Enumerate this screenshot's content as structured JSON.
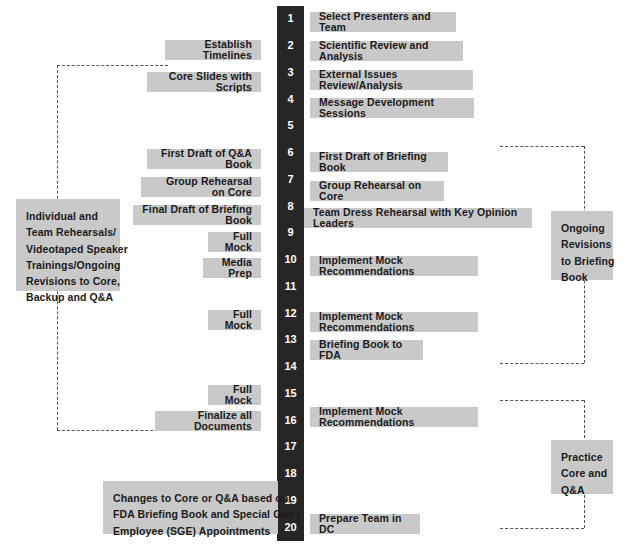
{
  "diagram": {
    "colors": {
      "spine": "#262626",
      "box_fill": "#c9c9c9",
      "box_text": "#1a1a1a",
      "spine_text": "#ffffff",
      "connector": "#555555",
      "background": "#ffffff"
    },
    "spine": {
      "name": "week-number-column",
      "numbers": [
        "1",
        "2",
        "3",
        "4",
        "5",
        "6",
        "7",
        "8",
        "9",
        "10",
        "11",
        "12",
        "13",
        "14",
        "15",
        "16",
        "17",
        "18",
        "19",
        "20"
      ]
    },
    "right_boxes": [
      {
        "label": "Select Presenters and Team",
        "row": 1,
        "x": 310,
        "y": 12,
        "w": 146,
        "h": 20
      },
      {
        "label": "Scientific Review and Analysis",
        "row": 2,
        "x": 310,
        "y": 41,
        "w": 153,
        "h": 20
      },
      {
        "label": "External Issues Review/Analysis",
        "row": 3,
        "x": 310,
        "y": 70,
        "w": 163,
        "h": 20
      },
      {
        "label": "Message Development Sessions",
        "row": 4,
        "x": 310,
        "y": 98,
        "w": 164,
        "h": 20
      },
      {
        "label": "First Draft of Briefing Book",
        "row": 6,
        "x": 310,
        "y": 152,
        "w": 138,
        "h": 20
      },
      {
        "label": "Group Rehearsal on Core",
        "row": 7,
        "x": 310,
        "y": 181,
        "w": 134,
        "h": 20
      },
      {
        "label": "Team Dress Rehearsal with Key Opinion Leaders",
        "row": 8,
        "x": 304,
        "y": 208,
        "w": 228,
        "h": 20
      },
      {
        "label": "Implement Mock Recommendations",
        "row": 10,
        "x": 310,
        "y": 256,
        "w": 168,
        "h": 20
      },
      {
        "label": "Implement Mock Recommendations",
        "row": 12,
        "x": 310,
        "y": 312,
        "w": 168,
        "h": 20
      },
      {
        "label": "Briefing Book to FDA",
        "row": 13,
        "x": 310,
        "y": 340,
        "w": 113,
        "h": 20
      },
      {
        "label": "Implement Mock Recommendations",
        "row": 16,
        "x": 310,
        "y": 407,
        "w": 168,
        "h": 20
      },
      {
        "label": "Prepare Team in DC",
        "row": 20,
        "x": 310,
        "y": 514,
        "w": 110,
        "h": 20
      }
    ],
    "left_boxes": [
      {
        "label": "Establish Timelines",
        "row": 2,
        "x": 165,
        "y": 40,
        "w": 96,
        "h": 20
      },
      {
        "label": "Core Slides with Scripts",
        "row": 3,
        "x": 147,
        "y": 72,
        "w": 114,
        "h": 20
      },
      {
        "label": "First Draft of Q&A Book",
        "row": 6,
        "x": 147,
        "y": 149,
        "w": 114,
        "h": 20
      },
      {
        "label": "Group Rehearsal on Core",
        "row": 7,
        "x": 141,
        "y": 177,
        "w": 120,
        "h": 20
      },
      {
        "label": "Final Draft of Briefing Book",
        "row": 8,
        "x": 133,
        "y": 205,
        "w": 128,
        "h": 20
      },
      {
        "label": "Full Mock",
        "row": 9,
        "x": 208,
        "y": 232,
        "w": 53,
        "h": 20
      },
      {
        "label": "Media Prep",
        "row": 10,
        "x": 203,
        "y": 258,
        "w": 58,
        "h": 20
      },
      {
        "label": "Full Mock",
        "row": 12,
        "x": 208,
        "y": 310,
        "w": 53,
        "h": 20
      },
      {
        "label": "Full Mock",
        "row": 15,
        "x": 208,
        "y": 385,
        "w": 53,
        "h": 20
      },
      {
        "label": "Finalize all Documents",
        "row": 16,
        "x": 155,
        "y": 411,
        "w": 106,
        "h": 20
      }
    ],
    "block_boxes": [
      {
        "name": "individual-team-rehearsals-box",
        "lines": [
          "Individual and",
          "Team Rehearsals/",
          "Videotaped Speaker",
          "Trainings/Ongoing",
          "Revisions to Core,",
          "Backup and Q&A"
        ],
        "x": 16,
        "y": 199,
        "w": 104,
        "h": 92
      },
      {
        "name": "ongoing-revisions-box",
        "lines": [
          "Ongoing",
          "Revisions",
          "to Briefing",
          "Book"
        ],
        "x": 551,
        "y": 211,
        "w": 62,
        "h": 69
      },
      {
        "name": "practice-core-qa-box",
        "lines": [
          "Practice",
          "Core and",
          "Q&A"
        ],
        "x": 551,
        "y": 440,
        "w": 62,
        "h": 54
      },
      {
        "name": "fda-changes-box",
        "lines": [
          "Changes to Core or Q&A based on",
          "FDA Briefing Book and Special Gov't",
          "Employee (SGE) Appointments"
        ],
        "x": 103,
        "y": 481,
        "w": 175,
        "h": 53
      }
    ],
    "connectors": [
      {
        "name": "left-bracket",
        "x1": 57,
        "y1": 65,
        "x2": 168,
        "y2": 430
      },
      {
        "name": "right-bracket-upper",
        "x1": 500,
        "y1": 146,
        "x2": 584,
        "y2": 363
      },
      {
        "name": "right-bracket-lower",
        "x1": 500,
        "y1": 400,
        "x2": 584,
        "y2": 528
      }
    ]
  }
}
